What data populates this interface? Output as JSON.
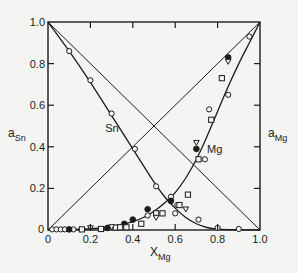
{
  "chart_data": {
    "type": "scatter",
    "title": "",
    "xlabel": {
      "main": "X",
      "sub": "Mg"
    },
    "ylabel_left": {
      "main": "a",
      "sub": "Sn"
    },
    "ylabel_right": {
      "main": "a",
      "sub": "Mg"
    },
    "xlim": [
      0,
      1.0
    ],
    "ylim": [
      0,
      1.0
    ],
    "grid": false,
    "x_ticks": [
      {
        "value": 0,
        "label": "0"
      },
      {
        "value": 0.2,
        "label": "0.2"
      },
      {
        "value": 0.4,
        "label": "0.4"
      },
      {
        "value": 0.6,
        "label": "0.6"
      },
      {
        "value": 0.8,
        "label": "0.8"
      },
      {
        "value": 1.0,
        "label": "1.0"
      }
    ],
    "y_ticks": [
      {
        "value": 0,
        "label": "0"
      },
      {
        "value": 0.2,
        "label": "0.2"
      },
      {
        "value": 0.4,
        "label": "0.4"
      },
      {
        "value": 0.6,
        "label": "0.6"
      },
      {
        "value": 0.8,
        "label": "0.8"
      },
      {
        "value": 1.0,
        "label": "1.0"
      }
    ],
    "reference_lines": [
      {
        "name": "raoult-sn",
        "x": [
          0,
          1
        ],
        "y": [
          1,
          0
        ]
      },
      {
        "name": "raoult-mg",
        "x": [
          0,
          1
        ],
        "y": [
          0,
          1
        ]
      }
    ],
    "curves": [
      {
        "name": "Sn",
        "label": "Sn",
        "label_at": [
          0.27,
          0.47
        ],
        "x": [
          0,
          0.1,
          0.2,
          0.3,
          0.4,
          0.5,
          0.55,
          0.6,
          0.65,
          0.7,
          0.75,
          0.8,
          0.9,
          1.0
        ],
        "y": [
          1.0,
          0.86,
          0.71,
          0.55,
          0.39,
          0.23,
          0.16,
          0.105,
          0.06,
          0.03,
          0.012,
          0.004,
          0.001,
          0
        ]
      },
      {
        "name": "Mg",
        "label": "Mg",
        "label_at": [
          0.75,
          0.37
        ],
        "x": [
          0,
          0.1,
          0.2,
          0.3,
          0.4,
          0.45,
          0.5,
          0.55,
          0.6,
          0.65,
          0.7,
          0.75,
          0.8,
          0.85,
          0.9,
          0.95,
          1.0
        ],
        "y": [
          0,
          0.002,
          0.006,
          0.015,
          0.04,
          0.06,
          0.09,
          0.13,
          0.18,
          0.25,
          0.34,
          0.45,
          0.57,
          0.69,
          0.8,
          0.9,
          1.0
        ]
      }
    ],
    "series": [
      {
        "name": "open-circle",
        "marker": "circle-open",
        "points": [
          [
            0.1,
            0.86
          ],
          [
            0.2,
            0.72
          ],
          [
            0.3,
            0.56
          ],
          [
            0.41,
            0.39
          ],
          [
            0.51,
            0.21
          ],
          [
            0.58,
            0.16
          ],
          [
            0.61,
            0.12
          ],
          [
            0.71,
            0.05
          ],
          [
            0.8,
            0.01
          ],
          [
            0.9,
            0.005
          ],
          [
            0.02,
            0.003
          ],
          [
            0.04,
            0.003
          ],
          [
            0.06,
            0.003
          ],
          [
            0.08,
            0.003
          ],
          [
            0.12,
            0.003
          ],
          [
            0.47,
            0.07
          ],
          [
            0.6,
            0.08
          ],
          [
            0.74,
            0.34
          ],
          [
            0.76,
            0.58
          ],
          [
            0.85,
            0.65
          ],
          [
            0.95,
            0.93
          ]
        ]
      },
      {
        "name": "filled-circle",
        "marker": "circle-filled",
        "points": [
          [
            0.1,
            0.003
          ],
          [
            0.28,
            0.01
          ],
          [
            0.36,
            0.03
          ],
          [
            0.4,
            0.05
          ],
          [
            0.47,
            0.1
          ],
          [
            0.58,
            0.14
          ],
          [
            0.7,
            0.39
          ],
          [
            0.85,
            0.83
          ]
        ]
      },
      {
        "name": "open-square",
        "marker": "square-open",
        "points": [
          [
            0.16,
            0.003
          ],
          [
            0.25,
            0.005
          ],
          [
            0.32,
            0.012
          ],
          [
            0.34,
            0.013
          ],
          [
            0.37,
            0.013
          ],
          [
            0.44,
            0.03
          ],
          [
            0.51,
            0.08
          ],
          [
            0.62,
            0.12
          ],
          [
            0.66,
            0.17
          ],
          [
            0.71,
            0.34
          ],
          [
            0.77,
            0.53
          ],
          [
            0.82,
            0.73
          ],
          [
            0.54,
            0.08
          ]
        ]
      },
      {
        "name": "open-triangle",
        "marker": "triangle-open",
        "points": [
          [
            0.2,
            0.01
          ],
          [
            0.3,
            0.015
          ],
          [
            0.51,
            0.06
          ],
          [
            0.65,
            0.1
          ],
          [
            0.7,
            0.42
          ],
          [
            0.85,
            0.81
          ]
        ]
      }
    ]
  }
}
